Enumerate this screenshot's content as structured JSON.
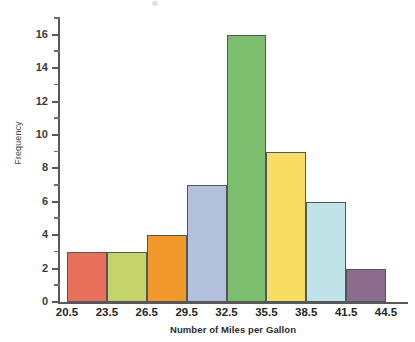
{
  "chart_data": {
    "type": "bar",
    "title": "",
    "xlabel": "Number of Miles per Gallon",
    "ylabel": "Frequency",
    "categories": [
      "20.5-23.5",
      "23.5-26.5",
      "26.5-29.5",
      "29.5-32.5",
      "32.5-35.5",
      "35.5-38.5",
      "38.5-41.5",
      "41.5-44.5"
    ],
    "values": [
      3,
      3,
      4,
      7,
      16,
      9,
      6,
      2
    ],
    "bin_edges": [
      20.5,
      23.5,
      26.5,
      29.5,
      32.5,
      35.5,
      38.5,
      41.5,
      44.5
    ],
    "bar_colors": [
      "#E8705A",
      "#C4D46A",
      "#F0992A",
      "#B3C0DC",
      "#7DBE6E",
      "#F7DE62",
      "#BFE3E6",
      "#8C6C8E"
    ],
    "ylim": [
      0,
      17
    ],
    "xlim": [
      20.5,
      44.5
    ],
    "y_major_ticks": [
      0,
      2,
      4,
      6,
      8,
      10,
      12,
      14,
      16
    ],
    "y_minor_ticks": [
      1,
      3,
      5,
      7,
      9,
      11,
      13,
      15,
      17
    ],
    "x_tick_labels": [
      "20.5",
      "23.5",
      "26.5",
      "29.5",
      "32.5",
      "35.5",
      "38.5",
      "41.5",
      "44.5"
    ],
    "grid": false,
    "legend": false,
    "legend_position": "none"
  },
  "axes": {
    "y_title": "Frequency",
    "x_title": "Number of Miles per Gallon",
    "y_labels": [
      "16",
      "14",
      "12",
      "10",
      "8",
      "6",
      "4",
      "2",
      "0"
    ],
    "x_labels": [
      "20.5",
      "23.5",
      "26.5",
      "29.5",
      "32.5",
      "35.5",
      "38.5",
      "41.5",
      "44.5"
    ]
  },
  "style": {
    "axis_color": "#58585a",
    "bar_stroke": "#55555a",
    "background": "#ffffff"
  }
}
